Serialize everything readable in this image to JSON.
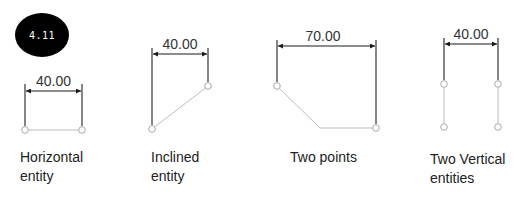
{
  "badge": {
    "label": "4.11"
  },
  "figures": [
    {
      "dimension": "40.00",
      "caption_line1": "Horizontal",
      "caption_line2": "entity"
    },
    {
      "dimension": "40.00",
      "caption_line1": "Inclined",
      "caption_line2": "entity"
    },
    {
      "dimension": "70.00",
      "caption_line1": "Two points",
      "caption_line2": ""
    },
    {
      "dimension": "40.00",
      "caption_line1": "Two Vertical",
      "caption_line2": "entities"
    }
  ],
  "colors": {
    "dimension_line": "#1a1a1a",
    "entity_line": "#bdbdbd",
    "point": "#aaaaaa"
  }
}
